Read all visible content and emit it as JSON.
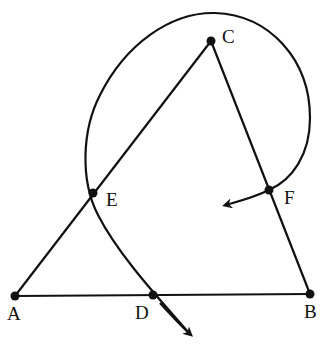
{
  "diagram": {
    "type": "geometry",
    "points": {
      "A": {
        "label": "A",
        "x": 15,
        "y": 296
      },
      "B": {
        "label": "B",
        "x": 310,
        "y": 294
      },
      "C": {
        "label": "C",
        "x": 211,
        "y": 41
      },
      "D": {
        "label": "D",
        "x": 153,
        "y": 295
      },
      "E": {
        "label": "E",
        "x": 93,
        "y": 193
      },
      "F": {
        "label": "F",
        "x": 269,
        "y": 190
      }
    },
    "segments": [
      "AB",
      "AC",
      "BC"
    ],
    "arc": {
      "from": "D",
      "through": [
        "E",
        "C"
      ],
      "to": "F",
      "arrows": [
        "beyond D",
        "beyond F"
      ]
    },
    "colors": {
      "stroke": "#111111",
      "background": "#ffffff"
    }
  }
}
